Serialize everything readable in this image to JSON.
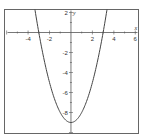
{
  "chart_data": {
    "type": "line",
    "title": "",
    "xlabel": "x",
    "ylabel": "y",
    "function": "y = x^2 - 9",
    "xlim": [
      -6.2,
      6.3
    ],
    "ylim": [
      -10.1,
      2.3
    ],
    "grid": false,
    "legend": null,
    "x_ticks": [
      -4,
      -2,
      2,
      4,
      6
    ],
    "x_tick_labels": [
      "-4",
      "-2",
      "2",
      "4",
      "6"
    ],
    "y_ticks": [
      2,
      -2,
      -4,
      -6,
      -8
    ],
    "y_tick_labels": [
      "2",
      "-2",
      "-4",
      "-6",
      "-8"
    ],
    "series": [
      {
        "name": "parabola",
        "x": [
          -3.4,
          -3,
          -2,
          -1,
          0,
          1,
          2,
          3,
          3.4
        ],
        "y": [
          2.56,
          0,
          -5,
          -8,
          -9,
          -8,
          -5,
          0,
          2.56
        ]
      }
    ],
    "colors": {
      "curve": "#444444",
      "axes": "#555555",
      "frame": "#666666"
    }
  }
}
